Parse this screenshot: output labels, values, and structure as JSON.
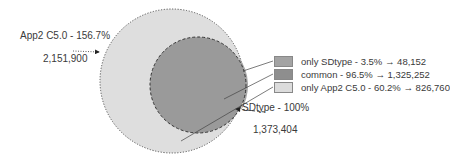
{
  "sets": {
    "outer": {
      "label": "App2 C5.0 - 156.7%",
      "count": "2,151,900",
      "color": "#dedede"
    },
    "inner": {
      "label": "SDtype - 100%",
      "count": "1,373,404",
      "color": "#9a9a9a"
    }
  },
  "legend": [
    {
      "label": "only SDtype - 3.5% → 48,152",
      "color": "#a3a3a3"
    },
    {
      "label": "common - 96.5%  → 1,325,252",
      "color": "#8e8e8e"
    },
    {
      "label": "only App2 C5.0 - 60.2% → 826,760",
      "color": "#dcdcdc"
    }
  ]
}
